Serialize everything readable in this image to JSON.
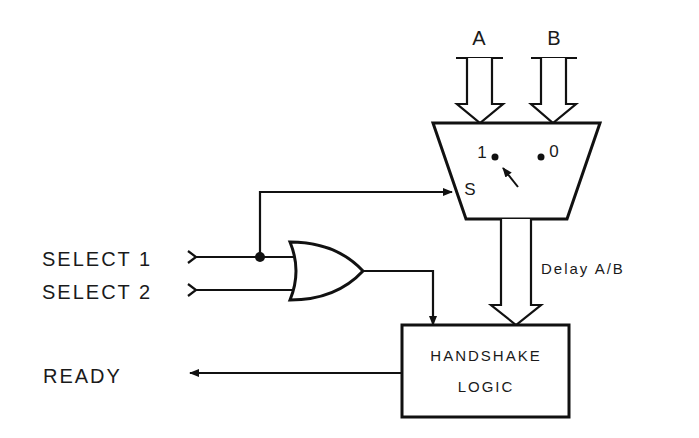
{
  "diagram": {
    "type": "block-diagram",
    "inputs": {
      "bus_a": "A",
      "bus_b": "B",
      "select_1": "SELECT 1",
      "select_2": "SELECT 2"
    },
    "mux": {
      "input_1_label": "1",
      "input_0_label": "0",
      "select_label": "S"
    },
    "delay_label": "Delay A/B",
    "handshake": {
      "line1": "HANDSHAKE",
      "line2": "LOGIC"
    },
    "output_label": "READY",
    "gate": "OR"
  }
}
